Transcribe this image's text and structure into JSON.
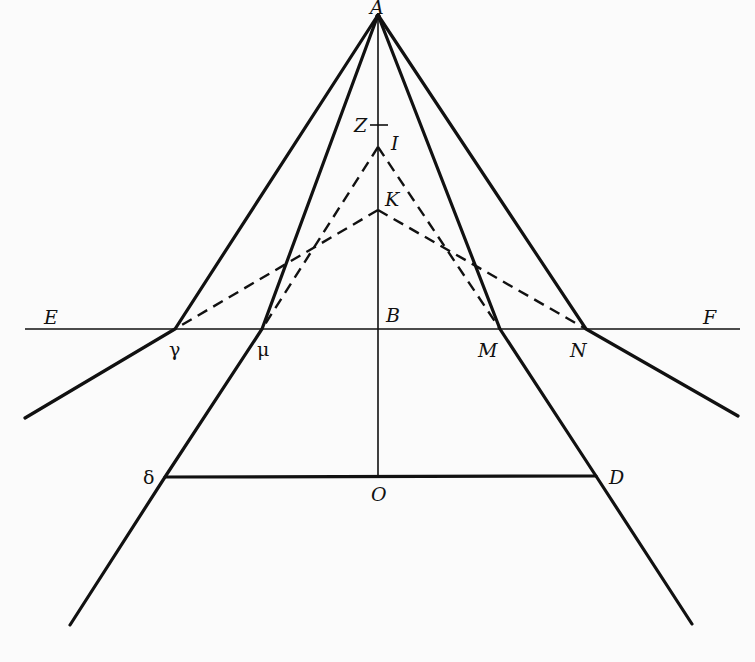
{
  "diagram": {
    "labels": {
      "A": "A",
      "Z": "Z",
      "I": "I",
      "K": "K",
      "E": "E",
      "F": "F",
      "B": "B",
      "gamma": "γ",
      "mu": "μ",
      "M": "M",
      "N": "N",
      "delta": "δ",
      "D": "D",
      "O": "O"
    },
    "points": {
      "A": [
        378,
        15
      ],
      "Z": [
        378,
        125
      ],
      "I": [
        378,
        147
      ],
      "K": [
        378,
        210
      ],
      "B": [
        378,
        329
      ],
      "O": [
        378,
        477
      ],
      "gamma": [
        175,
        329
      ],
      "mu": [
        262,
        329
      ],
      "M": [
        500,
        329
      ],
      "N": [
        586,
        329
      ],
      "delta": [
        165,
        477
      ],
      "D": [
        596,
        476
      ]
    },
    "colors": {
      "ink": "#111111",
      "paper": "#fbfbfb"
    }
  }
}
